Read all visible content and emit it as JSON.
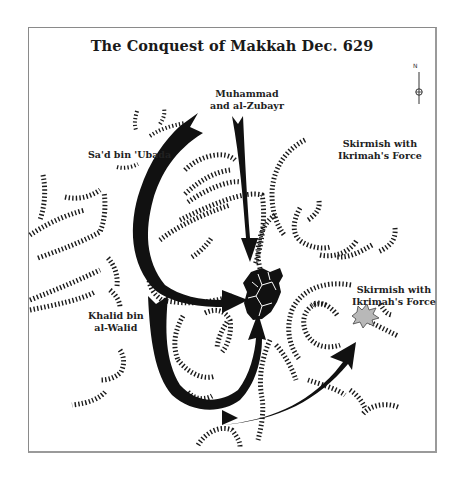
{
  "map": {
    "title": "The Conquest of Makkah Dec. 629",
    "north_arrow": {
      "label": "N",
      "icon": "north-arrow-icon"
    },
    "labels": {
      "muhammad_line1": "Muhammad",
      "muhammad_line2": "and al-Zubayr",
      "sad_bin_ubada": "Sa'd bin 'Ubada",
      "skirmish_top_line1": "Skirmish with",
      "skirmish_top_line2": "Ikrimah's Force",
      "skirmish_mid_line1": "Skirmish with",
      "skirmish_mid_line2": "Ikrimah's Force",
      "khalid_line1": "Khalid bin",
      "khalid_line2": "al-Walid"
    },
    "markers": {
      "city": "Makkah (city symbol)",
      "skirmish": "skirmish-burst"
    },
    "colors": {
      "arrow": "#111111",
      "hachure": "#1a1a1a",
      "skirmish_fill": "#b8b8b8",
      "frame": "#8a8a8a",
      "background": "#ffffff"
    }
  }
}
